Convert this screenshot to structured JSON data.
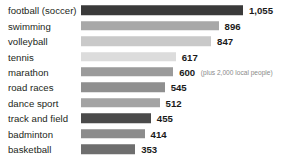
{
  "chart_data": {
    "type": "bar",
    "orientation": "horizontal",
    "title": "",
    "xlabel": "",
    "ylabel": "",
    "grid": false,
    "legend": null,
    "axis_visible": false,
    "xlim": [
      0,
      1055
    ],
    "categories": [
      "football (soccer)",
      "swimming",
      "volleyball",
      "tennis",
      "marathon",
      "road races",
      "dance sport",
      "track and field",
      "badminton",
      "basketball"
    ],
    "values": [
      1055,
      896,
      847,
      617,
      600,
      545,
      512,
      455,
      414,
      353
    ],
    "value_labels": [
      "1,055",
      "896",
      "847",
      "617",
      "600",
      "545",
      "512",
      "455",
      "414",
      "353"
    ],
    "bar_colors": [
      "#3a3a3a",
      "#a8a8a8",
      "#c9c9c9",
      "#dcdcdc",
      "#9b9b9b",
      "#8f8f8f",
      "#a3a3a3",
      "#4a4a4a",
      "#8c8c8c",
      "#6e6e6e"
    ],
    "annotations": [
      {
        "category": "marathon",
        "text": "(plus 2,000 local people)"
      }
    ]
  },
  "style": {
    "background": "#ffffff",
    "label_color": "#231f20",
    "value_color": "#1a1a1a",
    "annotation_color": "#8a8a8a"
  }
}
